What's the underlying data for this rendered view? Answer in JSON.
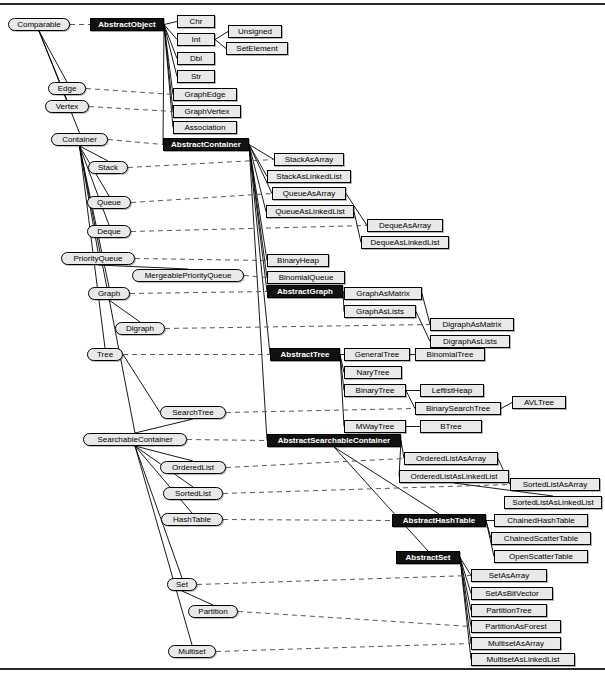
{
  "diagram": {
    "kind": "uml-class-hierarchy",
    "colors": {
      "abstract_fill": "#111111",
      "abstract_text": "#ffffff",
      "class_fill": "#e9e9e9",
      "class_text": "#000000",
      "interface_fill": "#e9e9e9",
      "border": "#000000",
      "inheritance_line": "#000000",
      "realization_line": "#555555",
      "background": "#ffffff"
    },
    "legend": {
      "rounded_node": "interface",
      "black_node": "abstract class",
      "white_node": "concrete class",
      "solid_edge": "inheritance",
      "dashed_edge": "implements"
    }
  },
  "nodes": {
    "interfaces": [
      {
        "id": "comparable",
        "label": "Comparable",
        "x": 8,
        "y": 18,
        "w": 62
      },
      {
        "id": "edge",
        "label": "Edge",
        "x": 48,
        "y": 82,
        "w": 38
      },
      {
        "id": "vertex",
        "label": "Vertex",
        "x": 45,
        "y": 100,
        "w": 44
      },
      {
        "id": "container",
        "label": "Container",
        "x": 51,
        "y": 133,
        "w": 57
      },
      {
        "id": "stack",
        "label": "Stack",
        "x": 88,
        "y": 161,
        "w": 40
      },
      {
        "id": "queue",
        "label": "Queue",
        "x": 87,
        "y": 196,
        "w": 44
      },
      {
        "id": "deque",
        "label": "Deque",
        "x": 87,
        "y": 225,
        "w": 44
      },
      {
        "id": "priorityqueue",
        "label": "PriorityQueue",
        "x": 61,
        "y": 252,
        "w": 74
      },
      {
        "id": "mergeablepriorityqueue",
        "label": "MergeablePriorityQueue",
        "x": 132,
        "y": 269,
        "w": 112
      },
      {
        "id": "graph",
        "label": "Graph",
        "x": 88,
        "y": 287,
        "w": 42
      },
      {
        "id": "digraph",
        "label": "Digraph",
        "x": 115,
        "y": 322,
        "w": 50
      },
      {
        "id": "tree",
        "label": "Tree",
        "x": 87,
        "y": 348,
        "w": 36
      },
      {
        "id": "searchtree",
        "label": "SearchTree",
        "x": 160,
        "y": 406,
        "w": 66
      },
      {
        "id": "searchablecontainer",
        "label": "SearchableContainer",
        "x": 83,
        "y": 433,
        "w": 104
      },
      {
        "id": "orderedlist",
        "label": "OrderedList",
        "x": 160,
        "y": 461,
        "w": 66
      },
      {
        "id": "sortedlist",
        "label": "SortedList",
        "x": 163,
        "y": 487,
        "w": 60
      },
      {
        "id": "hashtable",
        "label": "HashTable",
        "x": 161,
        "y": 513,
        "w": 62
      },
      {
        "id": "set",
        "label": "Set",
        "x": 167,
        "y": 578,
        "w": 30
      },
      {
        "id": "partition",
        "label": "Partition",
        "x": 188,
        "y": 605,
        "w": 50
      },
      {
        "id": "multiset",
        "label": "Multiset",
        "x": 168,
        "y": 645,
        "w": 48
      }
    ],
    "abstract_classes": [
      {
        "id": "abstractobject",
        "label": "AbstractObject",
        "x": 90,
        "y": 18,
        "w": 74
      },
      {
        "id": "abstractcontainer",
        "label": "AbstractContainer",
        "x": 163,
        "y": 138,
        "w": 86
      },
      {
        "id": "abstractgraph",
        "label": "AbstractGraph",
        "x": 267,
        "y": 285,
        "w": 76
      },
      {
        "id": "abstracttree",
        "label": "AbstractTree",
        "x": 270,
        "y": 348,
        "w": 70
      },
      {
        "id": "abstractsearchablecontainer",
        "label": "AbstractSearchableContainer",
        "x": 267,
        "y": 434,
        "w": 134
      },
      {
        "id": "abstracthashtable",
        "label": "AbstractHashTable",
        "x": 392,
        "y": 514,
        "w": 94
      },
      {
        "id": "abstractset",
        "label": "AbstractSet",
        "x": 396,
        "y": 551,
        "w": 64
      }
    ],
    "classes": [
      {
        "id": "chr",
        "label": "Chr",
        "x": 177,
        "y": 15,
        "w": 38
      },
      {
        "id": "int",
        "label": "Int",
        "x": 177,
        "y": 33,
        "w": 38
      },
      {
        "id": "unsigned",
        "label": "Unsigned",
        "x": 228,
        "y": 25,
        "w": 54
      },
      {
        "id": "setelement",
        "label": "SetElement",
        "x": 226,
        "y": 42,
        "w": 62
      },
      {
        "id": "dbl",
        "label": "Dbl",
        "x": 177,
        "y": 52,
        "w": 38
      },
      {
        "id": "str",
        "label": "Str",
        "x": 177,
        "y": 70,
        "w": 38
      },
      {
        "id": "graphedge",
        "label": "GraphEdge",
        "x": 173,
        "y": 88,
        "w": 64
      },
      {
        "id": "graphvertex",
        "label": "GraphVertex",
        "x": 173,
        "y": 105,
        "w": 68
      },
      {
        "id": "association",
        "label": "Association",
        "x": 173,
        "y": 121,
        "w": 64
      },
      {
        "id": "stackasarray",
        "label": "StackAsArray",
        "x": 274,
        "y": 153,
        "w": 70
      },
      {
        "id": "stackaslinkedlist",
        "label": "StackAsLinkedList",
        "x": 267,
        "y": 170,
        "w": 84
      },
      {
        "id": "queueasarray",
        "label": "QueueAsArray",
        "x": 272,
        "y": 187,
        "w": 74
      },
      {
        "id": "queueaslinkedlist",
        "label": "QueueAsLinkedList",
        "x": 266,
        "y": 205,
        "w": 88
      },
      {
        "id": "dequeasarray",
        "label": "DequeAsArray",
        "x": 367,
        "y": 219,
        "w": 76
      },
      {
        "id": "dequeaslinkedlist",
        "label": "DequeAsLinkedList",
        "x": 361,
        "y": 236,
        "w": 88
      },
      {
        "id": "binaryheap",
        "label": "BinaryHeap",
        "x": 267,
        "y": 254,
        "w": 62
      },
      {
        "id": "binomialqueue",
        "label": "BinomialQueue",
        "x": 267,
        "y": 271,
        "w": 78
      },
      {
        "id": "graphasmatrix",
        "label": "GraphAsMatrix",
        "x": 344,
        "y": 287,
        "w": 78
      },
      {
        "id": "graphaslists",
        "label": "GraphAsLists",
        "x": 344,
        "y": 305,
        "w": 72
      },
      {
        "id": "digraphasmatrix",
        "label": "DigraphAsMatrix",
        "x": 430,
        "y": 318,
        "w": 84
      },
      {
        "id": "digraphaslists",
        "label": "DigraphAsLists",
        "x": 430,
        "y": 335,
        "w": 80
      },
      {
        "id": "generaltree",
        "label": "GeneralTree",
        "x": 344,
        "y": 348,
        "w": 66
      },
      {
        "id": "binomialtree",
        "label": "BinomialTree",
        "x": 415,
        "y": 348,
        "w": 70
      },
      {
        "id": "narytree",
        "label": "NaryTree",
        "x": 344,
        "y": 366,
        "w": 58
      },
      {
        "id": "binarytree",
        "label": "BinaryTree",
        "x": 344,
        "y": 384,
        "w": 62
      },
      {
        "id": "leftistheap",
        "label": "LeftistHeap",
        "x": 420,
        "y": 384,
        "w": 64
      },
      {
        "id": "binarysearchtree",
        "label": "BinarySearchTree",
        "x": 415,
        "y": 402,
        "w": 86
      },
      {
        "id": "avltree",
        "label": "AVLTree",
        "x": 512,
        "y": 396,
        "w": 54
      },
      {
        "id": "mwaytree",
        "label": "MWayTree",
        "x": 344,
        "y": 420,
        "w": 62
      },
      {
        "id": "btree",
        "label": "BTree",
        "x": 420,
        "y": 420,
        "w": 62
      },
      {
        "id": "orderedlistasarray",
        "label": "OrderedListAsArray",
        "x": 404,
        "y": 452,
        "w": 94
      },
      {
        "id": "orderedlistaslinkedlist",
        "label": "OrderedListAsLinkedList",
        "x": 399,
        "y": 470,
        "w": 110
      },
      {
        "id": "sortedlistasarray",
        "label": "SortedListAsArray",
        "x": 510,
        "y": 478,
        "w": 90
      },
      {
        "id": "sortedlistaslinkedlist",
        "label": "SortedListAsLinkedList",
        "x": 504,
        "y": 496,
        "w": 98
      },
      {
        "id": "chainedhashtable",
        "label": "ChainedHashTable",
        "x": 494,
        "y": 514,
        "w": 94
      },
      {
        "id": "chainedscattertable",
        "label": "ChainedScatterTable",
        "x": 491,
        "y": 532,
        "w": 100
      },
      {
        "id": "openscattertable",
        "label": "OpenScatterTable",
        "x": 494,
        "y": 550,
        "w": 94
      },
      {
        "id": "setasarray",
        "label": "SetAsArray",
        "x": 471,
        "y": 569,
        "w": 76
      },
      {
        "id": "setasbitvector",
        "label": "SetAsBitVector",
        "x": 471,
        "y": 587,
        "w": 82
      },
      {
        "id": "partitiontree",
        "label": "PartitionTree",
        "x": 471,
        "y": 604,
        "w": 76
      },
      {
        "id": "partitionasforest",
        "label": "PartitionAsForest",
        "x": 471,
        "y": 620,
        "w": 90
      },
      {
        "id": "multisetasarray",
        "label": "MultisetAsArray",
        "x": 471,
        "y": 637,
        "w": 90
      },
      {
        "id": "multisetaslinkedlist",
        "label": "MultisetAsLinkedList",
        "x": 471,
        "y": 653,
        "w": 104
      }
    ]
  },
  "edges": {
    "inheritance": [
      [
        "comparable",
        "edge"
      ],
      [
        "comparable",
        "vertex"
      ],
      [
        "comparable",
        "container"
      ],
      [
        "abstractobject",
        "chr"
      ],
      [
        "abstractobject",
        "int"
      ],
      [
        "abstractobject",
        "dbl"
      ],
      [
        "abstractobject",
        "str"
      ],
      [
        "abstractobject",
        "graphedge"
      ],
      [
        "abstractobject",
        "graphvertex"
      ],
      [
        "abstractobject",
        "association"
      ],
      [
        "abstractobject",
        "abstractcontainer"
      ],
      [
        "int",
        "unsigned"
      ],
      [
        "int",
        "setelement"
      ],
      [
        "container",
        "stack"
      ],
      [
        "container",
        "queue"
      ],
      [
        "container",
        "deque"
      ],
      [
        "container",
        "priorityqueue"
      ],
      [
        "container",
        "graph"
      ],
      [
        "container",
        "tree"
      ],
      [
        "container",
        "searchablecontainer"
      ],
      [
        "priorityqueue",
        "mergeablepriorityqueue"
      ],
      [
        "graph",
        "digraph"
      ],
      [
        "tree",
        "searchtree"
      ],
      [
        "searchablecontainer",
        "searchtree"
      ],
      [
        "searchablecontainer",
        "orderedlist"
      ],
      [
        "searchablecontainer",
        "sortedlist"
      ],
      [
        "searchablecontainer",
        "hashtable"
      ],
      [
        "searchablecontainer",
        "set"
      ],
      [
        "searchablecontainer",
        "multiset"
      ],
      [
        "set",
        "partition"
      ],
      [
        "abstractcontainer",
        "stackasarray"
      ],
      [
        "abstractcontainer",
        "stackaslinkedlist"
      ],
      [
        "abstractcontainer",
        "queueasarray"
      ],
      [
        "abstractcontainer",
        "queueaslinkedlist"
      ],
      [
        "abstractcontainer",
        "binaryheap"
      ],
      [
        "abstractcontainer",
        "binomialqueue"
      ],
      [
        "abstractcontainer",
        "abstractgraph"
      ],
      [
        "abstractcontainer",
        "abstracttree"
      ],
      [
        "abstractcontainer",
        "abstractsearchablecontainer"
      ],
      [
        "queueasarray",
        "dequeasarray"
      ],
      [
        "queueaslinkedlist",
        "dequeaslinkedlist"
      ],
      [
        "abstractgraph",
        "graphasmatrix"
      ],
      [
        "abstractgraph",
        "graphaslists"
      ],
      [
        "graphasmatrix",
        "digraphasmatrix"
      ],
      [
        "graphaslists",
        "digraphaslists"
      ],
      [
        "abstracttree",
        "generaltree"
      ],
      [
        "abstracttree",
        "narytree"
      ],
      [
        "abstracttree",
        "binarytree"
      ],
      [
        "abstracttree",
        "mwaytree"
      ],
      [
        "generaltree",
        "binomialtree"
      ],
      [
        "binarytree",
        "leftistheap"
      ],
      [
        "binarytree",
        "binarysearchtree"
      ],
      [
        "binarysearchtree",
        "avltree"
      ],
      [
        "mwaytree",
        "btree"
      ],
      [
        "abstractsearchablecontainer",
        "orderedlistasarray"
      ],
      [
        "abstractsearchablecontainer",
        "orderedlistaslinkedlist"
      ],
      [
        "abstractsearchablecontainer",
        "abstracthashtable"
      ],
      [
        "abstractsearchablecontainer",
        "abstractset"
      ],
      [
        "orderedlistasarray",
        "sortedlistasarray"
      ],
      [
        "orderedlistaslinkedlist",
        "sortedlistaslinkedlist"
      ],
      [
        "abstracthashtable",
        "chainedhashtable"
      ],
      [
        "abstracthashtable",
        "chainedscattertable"
      ],
      [
        "abstracthashtable",
        "openscattertable"
      ],
      [
        "abstractset",
        "setasarray"
      ],
      [
        "abstractset",
        "setasbitvector"
      ],
      [
        "abstractset",
        "partitiontree"
      ],
      [
        "abstractset",
        "partitionasforest"
      ],
      [
        "abstractset",
        "multisetasarray"
      ],
      [
        "abstractset",
        "multisetaslinkedlist"
      ]
    ],
    "realization": [
      [
        "comparable",
        "abstractobject"
      ],
      [
        "edge",
        "graphedge"
      ],
      [
        "vertex",
        "graphvertex"
      ],
      [
        "container",
        "abstractcontainer"
      ],
      [
        "stack",
        "stackasarray"
      ],
      [
        "queue",
        "queueasarray"
      ],
      [
        "deque",
        "dequeasarray"
      ],
      [
        "priorityqueue",
        "binaryheap"
      ],
      [
        "mergeablepriorityqueue",
        "binomialqueue"
      ],
      [
        "graph",
        "abstractgraph"
      ],
      [
        "digraph",
        "digraphasmatrix"
      ],
      [
        "tree",
        "abstracttree"
      ],
      [
        "searchtree",
        "binarysearchtree"
      ],
      [
        "searchablecontainer",
        "abstractsearchablecontainer"
      ],
      [
        "orderedlist",
        "orderedlistasarray"
      ],
      [
        "sortedlist",
        "sortedlistasarray"
      ],
      [
        "hashtable",
        "abstracthashtable"
      ],
      [
        "set",
        "setasarray"
      ],
      [
        "partition",
        "partitionasforest"
      ],
      [
        "multiset",
        "multisetasarray"
      ]
    ]
  }
}
